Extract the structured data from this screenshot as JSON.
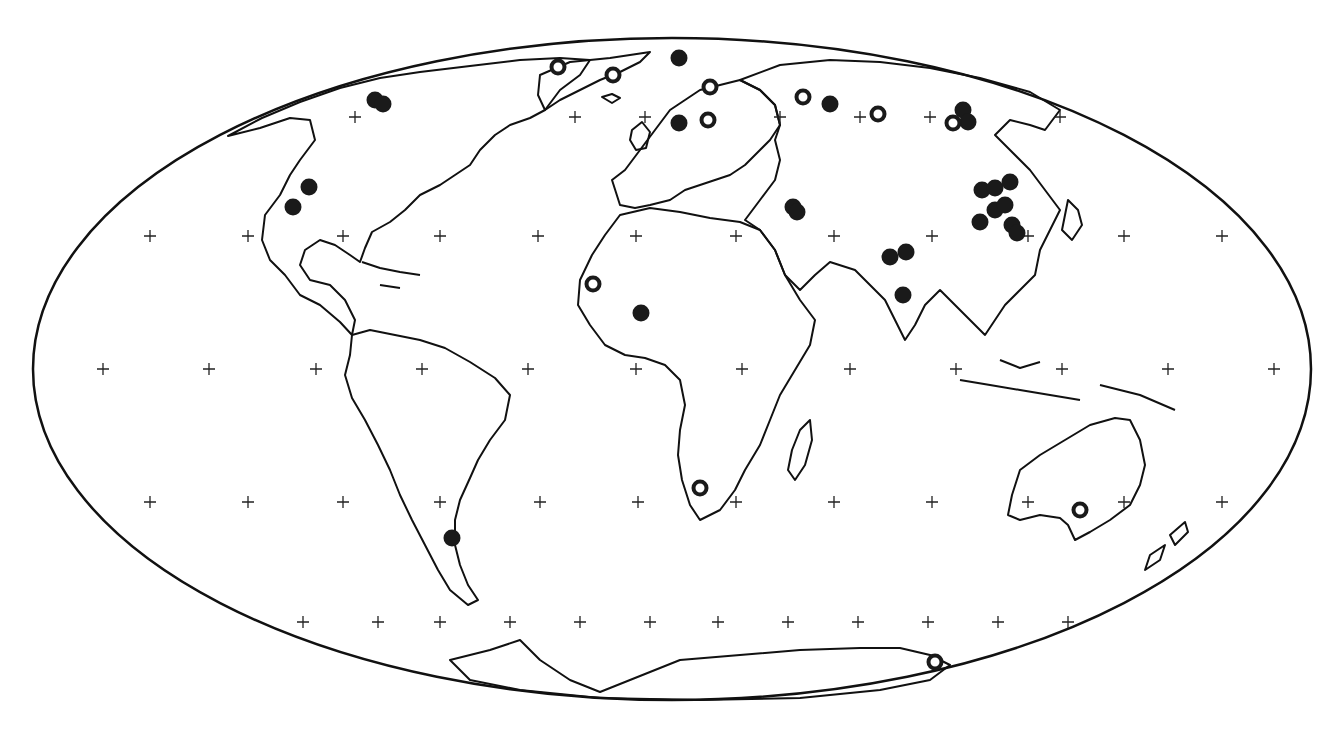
{
  "map": {
    "projection": "Mollweide",
    "ellipse": {
      "cx": 672,
      "cy": 369,
      "rx": 639,
      "ry": 331
    },
    "colors": {
      "ink": "#1a1a1a",
      "background": "#ffffff"
    },
    "grid_rows": [
      {
        "y": 117,
        "xs": [
          355,
          575,
          645,
          780,
          860,
          930,
          1060
        ]
      },
      {
        "y": 236,
        "xs": [
          150,
          248,
          343,
          440,
          538,
          636,
          736,
          834,
          932,
          1028,
          1124,
          1222
        ]
      },
      {
        "y": 369,
        "xs": [
          103,
          209,
          316,
          422,
          528,
          636,
          742,
          850,
          956,
          1062,
          1168,
          1274
        ]
      },
      {
        "y": 502,
        "xs": [
          150,
          248,
          343,
          440,
          540,
          638,
          736,
          834,
          932,
          1028,
          1124,
          1222
        ]
      },
      {
        "y": 622,
        "xs": [
          303,
          378,
          440,
          510,
          580,
          650,
          718,
          788,
          858,
          928,
          998,
          1068
        ]
      }
    ],
    "markers_filled": [
      [
        375,
        100
      ],
      [
        383,
        104
      ],
      [
        309,
        187
      ],
      [
        293,
        207
      ],
      [
        679,
        58
      ],
      [
        679,
        123
      ],
      [
        830,
        104
      ],
      [
        793,
        207
      ],
      [
        797,
        212
      ],
      [
        641,
        313
      ],
      [
        890,
        257
      ],
      [
        906,
        252
      ],
      [
        903,
        295
      ],
      [
        963,
        110
      ],
      [
        968,
        122
      ],
      [
        982,
        190
      ],
      [
        995,
        188
      ],
      [
        1010,
        182
      ],
      [
        980,
        222
      ],
      [
        995,
        210
      ],
      [
        1005,
        205
      ],
      [
        1012,
        225
      ],
      [
        1017,
        233
      ],
      [
        452,
        538
      ]
    ],
    "markers_open": [
      [
        558,
        67
      ],
      [
        613,
        75
      ],
      [
        710,
        87
      ],
      [
        708,
        120
      ],
      [
        803,
        97
      ],
      [
        878,
        114
      ],
      [
        953,
        123
      ],
      [
        593,
        284
      ],
      [
        700,
        488
      ],
      [
        1080,
        510
      ],
      [
        935,
        662
      ]
    ]
  }
}
